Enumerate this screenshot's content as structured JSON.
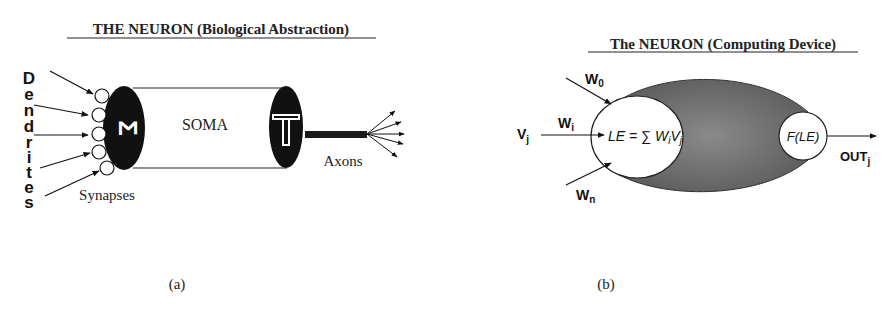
{
  "panel_a": {
    "title": "THE  NEURON  (Biological  Abstraction)",
    "dendrites_letters": [
      "D",
      "e",
      "n",
      "d",
      "r",
      "i",
      "t",
      "e",
      "s"
    ],
    "dendrites_label": "Dendrites",
    "synapses_label": "Synapses",
    "soma_label": "SOMA",
    "sum_symbol": "Σ",
    "threshold_symbol": "T",
    "axons_label": "Axons",
    "caption": "(a)"
  },
  "panel_b": {
    "title": "The  NEURON  (Computing  Device)",
    "input_label": "V",
    "input_sub": "j",
    "weight_0": "W",
    "weight_0_sub": "0",
    "weight_i": "W",
    "weight_i_sub": "i",
    "weight_n": "W",
    "weight_n_sub": "n",
    "le_formula": "LE = ∑  W",
    "le_formula_sub": "i",
    "le_formula_tail": "V",
    "le_formula_tail_sub": "j",
    "activation": "F(LE)",
    "output_label": "OUT",
    "output_sub": "j",
    "caption": "(b)"
  },
  "colors": {
    "ink": "#111111",
    "soma_fill": "#ffffff",
    "body_fill": "#6e6e6e"
  }
}
